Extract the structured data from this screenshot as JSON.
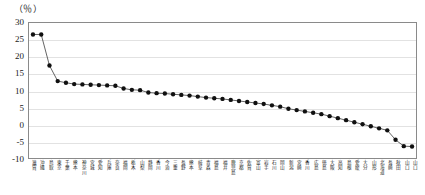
{
  "chart_data": {
    "type": "line",
    "title": "",
    "subtitle": "",
    "xlabel": "",
    "ylabel": "",
    "unit_label": "（％）",
    "ylim": [
      -10,
      30
    ],
    "yticks": [
      30,
      25,
      20,
      15,
      10,
      5,
      0,
      -5,
      -10
    ],
    "ytick_labels": [
      "30",
      "25",
      "20",
      "15",
      "10",
      "5",
      "0",
      "-5",
      "-10"
    ],
    "grid": true,
    "legend": "none",
    "marker": "filled-circle",
    "line_color": "#3c3c3c",
    "marker_color": "#101010",
    "categories": [
      "滋賀",
      "沖縄",
      "鳥取",
      "東京",
      "千葉",
      "熊本",
      "神奈川",
      "宮城",
      "愛知",
      "兵庫",
      "奈良",
      "福岡",
      "栃木",
      "山梨",
      "静岡",
      "香川",
      "今治",
      "三重",
      "長野",
      "熊本",
      "岐阜",
      "青森",
      "福島",
      "福井",
      "鹿児島",
      "京都",
      "佐賀",
      "富山",
      "岩手",
      "石川",
      "岡山",
      "新潟",
      "宮崎",
      "香川",
      "広島",
      "徳島",
      "大阪",
      "高知",
      "島根",
      "愛媛",
      "大分",
      "山形",
      "北海道",
      "長崎",
      "秋田",
      "山口",
      "山口"
    ],
    "values": [
      26.6,
      26.6,
      17.4,
      12.8,
      12.3,
      11.9,
      11.8,
      11.7,
      11.6,
      11.5,
      11.4,
      10.6,
      10.2,
      10.1,
      9.4,
      9.2,
      9.1,
      8.9,
      8.7,
      8.5,
      8.2,
      7.9,
      7.7,
      7.5,
      7.2,
      6.9,
      6.6,
      6.3,
      6.0,
      5.6,
      5.2,
      4.6,
      4.2,
      3.8,
      3.4,
      3.0,
      2.4,
      1.8,
      1.2,
      0.6,
      0.0,
      -0.6,
      -1.2,
      -1.8,
      -4.6,
      -6.5,
      -6.6
    ]
  }
}
